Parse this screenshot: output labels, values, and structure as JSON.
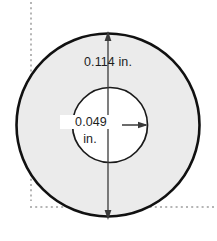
{
  "figure": {
    "name": "annulus-washer-cross-section",
    "type": "technical-dimension-diagram",
    "background_color": "#ffffff",
    "shape": {
      "outer_circle": {
        "name": "outer-circle",
        "fill_color": "#ebebeb",
        "stroke_color": "#111111",
        "center_x": 108,
        "center_y": 125,
        "radius": 92
      },
      "inner_circle": {
        "name": "inner-circle",
        "fill_color": "#ffffff",
        "stroke_color": "#1a1a1a",
        "center_x": 110,
        "center_y": 125,
        "radius": 38
      }
    },
    "dimensions": [
      {
        "id": "outer-diameter",
        "value": "0.114",
        "unit": "in.",
        "label": "0.114 in.",
        "orientation": "vertical",
        "arrow_color": "#333333"
      },
      {
        "id": "inner-diameter",
        "value": "0.049",
        "unit": "in.",
        "label_line1": "0.049",
        "label_line2": "in.",
        "orientation": "horizontal",
        "arrow_color": "#333333"
      }
    ],
    "guides": [
      {
        "id": "vertical-reference-line",
        "style": "dotted",
        "color": "#b5b5b5",
        "orientation": "vertical"
      },
      {
        "id": "horizontal-reference-line",
        "style": "dotted",
        "color": "#b5b5b5",
        "orientation": "horizontal"
      }
    ]
  }
}
